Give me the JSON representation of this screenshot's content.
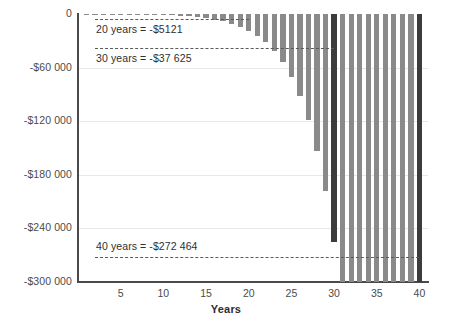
{
  "chart_data": {
    "type": "bar",
    "title": "",
    "subtitle": "",
    "xlabel": "Years",
    "ylabel": "",
    "xlim": [
      0,
      41
    ],
    "ylim": [
      -300000,
      0
    ],
    "grid": true,
    "legend": null,
    "x_ticks": [
      5,
      10,
      15,
      20,
      25,
      30,
      35,
      40
    ],
    "x_tick_labels": [
      "5",
      "10",
      "15",
      "20",
      "25",
      "30",
      "35",
      "40"
    ],
    "y_ticks": [
      0,
      -60000,
      -120000,
      -180000,
      -240000,
      -300000
    ],
    "y_tick_labels": [
      "0",
      "-$60 000",
      "-$120 000",
      "-$180 000",
      "-$240 000",
      "-$300 000"
    ],
    "categories": [
      1,
      2,
      3,
      4,
      5,
      6,
      7,
      8,
      9,
      10,
      11,
      12,
      13,
      14,
      15,
      16,
      17,
      18,
      19,
      20,
      21,
      22,
      23,
      24,
      25,
      26,
      27,
      28,
      29,
      30,
      31,
      32,
      33,
      34,
      35,
      36,
      37,
      38,
      39,
      40
    ],
    "values": [
      -16,
      -39,
      -71,
      -117,
      -180,
      -266,
      -383,
      -542,
      -756,
      -1043,
      -1425,
      -1933,
      -2604,
      -3487,
      -4647,
      -6167,
      -8157,
      -10758,
      -14154,
      -18580,
      -24341,
      -31829,
      -41545,
      -54128,
      -70393,
      -91387,
      -118440,
      -153233,
      -197867,
      -254958,
      -328000,
      -421000,
      -540000,
      -692000,
      -885000,
      -1130000,
      -1441000,
      -1835000,
      -2333000,
      -2962000
    ],
    "series_name": "Cumulative balance",
    "bar_color": "#8a8a8a",
    "highlight_color": "#3c3c3c",
    "highlight_categories": [
      30,
      40
    ],
    "annotations": [
      {
        "name": "annotation-20-years",
        "label": "20 years = -$5121",
        "year": 20,
        "value": -5121
      },
      {
        "name": "annotation-30-years",
        "label": "30 years = -$37 625",
        "year": 30,
        "value": -37625
      },
      {
        "name": "annotation-40-years",
        "label": "40 years = -$272 464",
        "year": 40,
        "value": -272464
      }
    ]
  },
  "axes": {
    "x_title": "Years"
  }
}
